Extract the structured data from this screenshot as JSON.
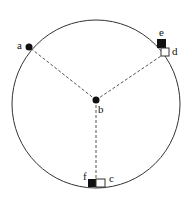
{
  "diagram": {
    "type": "circle-with-radii",
    "circle": {
      "cx": 96,
      "cy": 104,
      "r": 84,
      "stroke": "#333333"
    },
    "center_point": {
      "id": "b",
      "label": "b",
      "x": 96,
      "y": 100
    },
    "points": [
      {
        "id": "a",
        "label": "a",
        "x": 29,
        "y": 47,
        "style": "filled-dot"
      }
    ],
    "markers": [
      {
        "id": "e",
        "label": "e",
        "style": "filled-square",
        "x": 157,
        "y": 39,
        "size": 9
      },
      {
        "id": "d",
        "label": "d",
        "style": "open-square",
        "x": 161,
        "y": 48,
        "size": 8
      },
      {
        "id": "f",
        "label": "f",
        "style": "filled-square",
        "x": 88,
        "y": 179,
        "size": 8
      },
      {
        "id": "c",
        "label": "c",
        "style": "open-square",
        "x": 96,
        "y": 179,
        "size": 8
      }
    ],
    "radii": [
      {
        "from": "b",
        "to": "a",
        "style": "dashed"
      },
      {
        "from": "b",
        "to": "d",
        "style": "dashed"
      },
      {
        "from": "b",
        "to": "f",
        "style": "dashed"
      }
    ],
    "labels": {
      "a": "a",
      "b": "b",
      "c": "c",
      "d": "d",
      "e": "e",
      "f": "f"
    }
  }
}
